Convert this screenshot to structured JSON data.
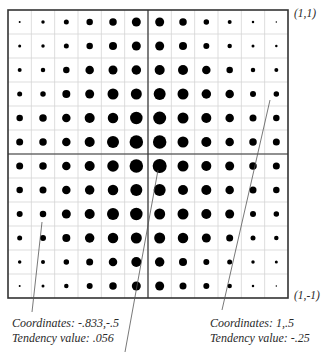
{
  "figure": {
    "grid": {
      "rows": 12,
      "cols": 12,
      "left": 8,
      "top": 10,
      "right": 288,
      "bottom": 298,
      "border_color": "#333333",
      "gridline_color": "#d4d4d4",
      "axis_line_color": "#333333",
      "dot_color": "#000000",
      "dot_diameters_px": [
        [
          2,
          3.5,
          5,
          6.5,
          7.5,
          9,
          9,
          7.5,
          5.5,
          4,
          2.5,
          1.5
        ],
        [
          3,
          3.5,
          5,
          6.5,
          8,
          9,
          9,
          8,
          6,
          4.5,
          3,
          2.5
        ],
        [
          4,
          4.5,
          6.5,
          8.5,
          9,
          9.5,
          10,
          10,
          8.5,
          6.5,
          4.5,
          4
        ],
        [
          5,
          5.5,
          8,
          9,
          11,
          11,
          12,
          11,
          9.5,
          8.5,
          6,
          5.5
        ],
        [
          6.5,
          7.5,
          8.5,
          10,
          10.5,
          12.5,
          13,
          11,
          10,
          8.5,
          7,
          6.5
        ],
        [
          7,
          7.5,
          8.5,
          10,
          12,
          13.5,
          13.5,
          11,
          10,
          8.5,
          7.5,
          7
        ],
        [
          7,
          7.5,
          8.5,
          10,
          11.5,
          13.5,
          14,
          11,
          10,
          9,
          7.5,
          7
        ],
        [
          6.5,
          7,
          8.5,
          9.5,
          10.5,
          12,
          12,
          10,
          10,
          8.5,
          7,
          6.5
        ],
        [
          6,
          6.5,
          9,
          10,
          12,
          12.5,
          11,
          11,
          10,
          9,
          6,
          5.5
        ],
        [
          5,
          6,
          8,
          9.5,
          10.5,
          11,
          11,
          10.5,
          9,
          7,
          5,
          4.5
        ],
        [
          3.5,
          4,
          5.5,
          7,
          8.5,
          10,
          9.5,
          8,
          6,
          5,
          3.5,
          3
        ],
        [
          2,
          3,
          4.5,
          6,
          7.5,
          9,
          9,
          7,
          6,
          4.5,
          2.5,
          1.5
        ]
      ]
    },
    "corner_labels": {
      "top_right": "(1,1)",
      "bottom_right": "(1,-1)"
    },
    "annotations": [
      {
        "line1": "Coordinates: -.833,-.5",
        "line2": "Tendency value: .056",
        "leader": {
          "x1": 42,
          "y1": 222,
          "x2": 32,
          "y2": 312
        }
      },
      {
        "line1": "Coordinates: 1,.5",
        "line2": "Tendency value: -.25",
        "leader": {
          "x1": 270,
          "y1": 100,
          "x2": 222,
          "y2": 310
        }
      }
    ],
    "center_leader": {
      "x1": 158,
      "y1": 170,
      "x2": 125,
      "y2": 352
    },
    "leader_color": "#555555"
  }
}
